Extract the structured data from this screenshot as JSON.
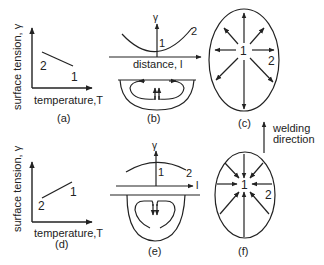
{
  "panels": {
    "a": {
      "label": "(a)",
      "ylabel": "surface tension, γ",
      "xlabel": "temperature,T",
      "point_high": "2",
      "point_low": "1"
    },
    "b": {
      "label": "(b)",
      "axis_y": "γ",
      "axis_x": "distance, l",
      "center_point": "1",
      "edge_point": "2"
    },
    "c": {
      "label": "(c)",
      "center_point": "1",
      "edge_point": "2"
    },
    "d": {
      "label": "(d)",
      "ylabel": "surface tension, γ",
      "xlabel": "temperature,T",
      "point_low": "2",
      "point_high": "1"
    },
    "e": {
      "label": "(e)",
      "axis_y": "γ",
      "axis_x": "l",
      "center_point": "1",
      "edge_point": "2"
    },
    "f": {
      "label": "(f)",
      "center_point": "1",
      "edge_point": "2"
    }
  },
  "welding_direction": {
    "line1": "welding",
    "line2": "direction"
  }
}
